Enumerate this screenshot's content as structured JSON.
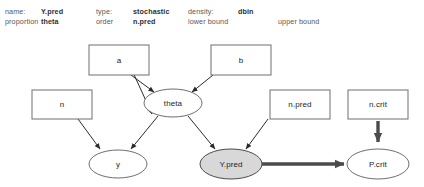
{
  "toolbar": {
    "row1": [
      {
        "label": "name:",
        "value": "Y.pred"
      },
      {
        "label": "type:",
        "value": "stochastic"
      },
      {
        "label": "density:",
        "value": "dbin"
      }
    ],
    "row2": [
      {
        "label": "proportion",
        "value": "theta"
      },
      {
        "label": "order",
        "value": "n.pred"
      },
      {
        "label": "lower bound",
        "value": ""
      },
      {
        "label": "upper bound",
        "value": ""
      }
    ],
    "fields": {
      "name_label": "name:",
      "name_value": "Y.pred",
      "type_label": "type:",
      "type_value": "stochastic",
      "density_label": "density:",
      "density_value": "dbin",
      "proportion_label": "proportion",
      "proportion_value": "theta",
      "order_label": "order",
      "order_value": "n.pred",
      "lower_bound_label": "lower bound",
      "upper_bound_label": "upper bound"
    }
  },
  "graph": {
    "selected_node": "Y.pred",
    "colors": {
      "selected_fill": "#d8d8d8",
      "node_fill": "#ffffff",
      "node_stroke": "#6e6e6e",
      "edge": "#2b2b2b",
      "edge_logical": "#4b4b4b"
    },
    "nodes": [
      {
        "id": "a",
        "label": "a",
        "shape": "rect",
        "state": "constant"
      },
      {
        "id": "b",
        "label": "b",
        "shape": "rect",
        "state": "constant"
      },
      {
        "id": "n",
        "label": "n",
        "shape": "rect",
        "state": "constant"
      },
      {
        "id": "n.pred",
        "label": "n.pred",
        "shape": "rect",
        "state": "constant"
      },
      {
        "id": "n.crit",
        "label": "n.crit",
        "shape": "rect",
        "state": "constant"
      },
      {
        "id": "theta",
        "label": "theta",
        "shape": "ellipse",
        "state": "stochastic"
      },
      {
        "id": "y",
        "label": "y",
        "shape": "ellipse",
        "state": "stochastic"
      },
      {
        "id": "Y.pred",
        "label": "Y.pred",
        "shape": "ellipse",
        "state": "selected"
      },
      {
        "id": "P.crit",
        "label": "P.crit",
        "shape": "ellipse",
        "state": "stochastic"
      }
    ],
    "edges": [
      {
        "from": "a",
        "to": "theta",
        "kind": "stochastic"
      },
      {
        "from": "b",
        "to": "theta",
        "kind": "stochastic"
      },
      {
        "from": "n",
        "to": "y",
        "kind": "stochastic"
      },
      {
        "from": "theta",
        "to": "y",
        "kind": "stochastic"
      },
      {
        "from": "theta",
        "to": "Y.pred",
        "kind": "stochastic"
      },
      {
        "from": "n.pred",
        "to": "Y.pred",
        "kind": "stochastic"
      },
      {
        "from": "Y.pred",
        "to": "P.crit",
        "kind": "logical"
      },
      {
        "from": "n.crit",
        "to": "P.crit",
        "kind": "logical"
      }
    ]
  }
}
